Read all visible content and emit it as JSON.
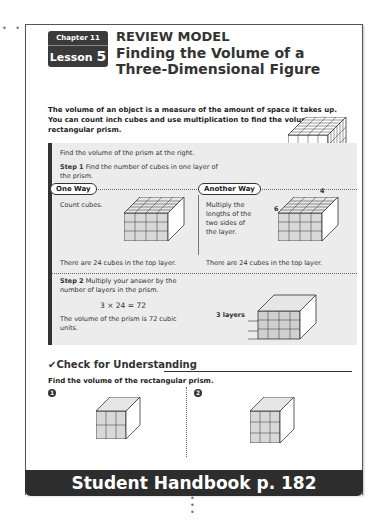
{
  "header": {
    "chapter": "Chapter 11",
    "lesson_word": "Lesson",
    "lesson_number": "5",
    "title_line1": "REVIEW MODEL",
    "title_line2": "Finding the Volume of a Three-Dimensional Figure"
  },
  "intro": "The volume of an object is a measure of the amount of space it takes up. You can count inch cubes and use multiplication to find the volume of a rectangular prism.",
  "panel": {
    "task": "Find the volume of the prism at the right.",
    "step1_label": "Step 1",
    "step1_text": "Find the number of cubes in one layer of the prism.",
    "one_way": {
      "label": "One Way",
      "text": "Count cubes.",
      "result": "There are 24 cubes in the top layer."
    },
    "another_way": {
      "label": "Another Way",
      "text": "Multiply the lengths of the two sides of the layer.",
      "dim_top": "4",
      "dim_side": "6",
      "result": "There are 24 cubes in the top layer."
    },
    "step2_label": "Step 2",
    "step2_text": "Multiply your answer by the number of layers in the prism.",
    "equation": "3 × 24 = 72",
    "conclusion": "The volume of the prism is 72 cubic units.",
    "layers_label": "3 layers"
  },
  "check": {
    "title": "Check for Understanding",
    "instruction": "Find the volume of the rectangular prism.",
    "problems": [
      {
        "number": "1"
      },
      {
        "number": "2"
      }
    ]
  },
  "footer": {
    "page_number": "182",
    "chapter": "Chapter 11"
  },
  "banner": "Student Handbook p. 182"
}
